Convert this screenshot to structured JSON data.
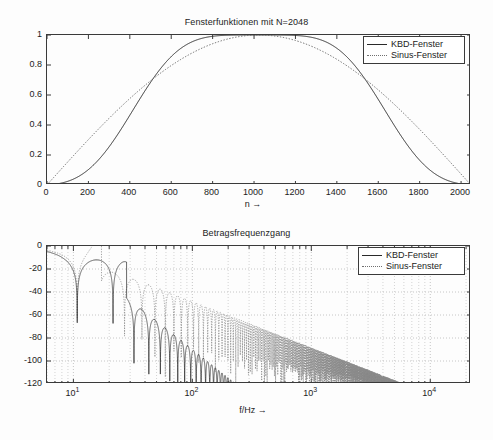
{
  "figure": {
    "background_color": "#fdfdfd",
    "line_color": "#2a2a2a",
    "dotted_color": "#707070",
    "grid_color": "#b8b8b8",
    "axis_color": "#3a3a3a"
  },
  "legend": {
    "entries": [
      {
        "label": "KBD-Fenster",
        "style": "solid"
      },
      {
        "label": "Sinus-Fenster",
        "style": "dotted"
      }
    ]
  },
  "chart_data": [
    {
      "type": "line",
      "id": "window-functions",
      "title": "Fensterfunktionen mit N=2048",
      "xlabel": "n →",
      "ylabel": "",
      "xscale": "linear",
      "yscale": "linear",
      "xlim": [
        0,
        2048
      ],
      "ylim": [
        0,
        1
      ],
      "grid": false,
      "xticks": [
        0,
        200,
        400,
        600,
        800,
        1000,
        1200,
        1400,
        1600,
        1800,
        2000
      ],
      "xtick_labels": [
        "0",
        "200",
        "400",
        "600",
        "800",
        "1000",
        "1200",
        "1400",
        "1600",
        "1800",
        "2000"
      ],
      "yticks": [
        0,
        0.2,
        0.4,
        0.6,
        0.8,
        1
      ],
      "ytick_labels": [
        "0",
        "0.2",
        "0.4",
        "0.6",
        "0.8",
        "1"
      ],
      "legend_position": "upper right",
      "series": [
        {
          "name": "KBD-Fenster",
          "style": "solid",
          "description": "Kaiser-Bessel-derived window, flat-topped near the center, reaching 1.0 between n=800 and n=1250, rising slowly from 0 at n=0.",
          "x": [
            0,
            50,
            100,
            150,
            200,
            250,
            300,
            350,
            400,
            450,
            500,
            550,
            600,
            650,
            700,
            750,
            800,
            850,
            900,
            950,
            1024,
            1100,
            1150,
            1200,
            1250,
            1300,
            1350,
            1400,
            1450,
            1500,
            1550,
            1600,
            1650,
            1700,
            1750,
            1800,
            1850,
            1900,
            1950,
            2000,
            2048
          ],
          "y": [
            0.0,
            0.004,
            0.014,
            0.031,
            0.056,
            0.09,
            0.133,
            0.186,
            0.248,
            0.32,
            0.4,
            0.484,
            0.57,
            0.655,
            0.737,
            0.81,
            0.873,
            0.924,
            0.961,
            0.985,
            1.0,
            0.993,
            0.978,
            0.95,
            0.908,
            0.852,
            0.784,
            0.706,
            0.622,
            0.535,
            0.45,
            0.368,
            0.292,
            0.224,
            0.166,
            0.118,
            0.079,
            0.048,
            0.025,
            0.008,
            0.0
          ]
        },
        {
          "name": "Sinus-Fenster",
          "style": "dotted",
          "description": "Sine window, sin(pi*(n+0.5)/N), peaking at 1.0 at the center n=1024 with a rounded top.",
          "x": [
            0,
            50,
            100,
            150,
            200,
            250,
            300,
            350,
            400,
            450,
            500,
            550,
            600,
            650,
            700,
            750,
            800,
            850,
            900,
            950,
            1024,
            1100,
            1150,
            1200,
            1250,
            1300,
            1350,
            1400,
            1450,
            1500,
            1550,
            1600,
            1650,
            1700,
            1750,
            1800,
            1850,
            1900,
            1950,
            2000,
            2048
          ],
          "y": [
            0.001,
            0.077,
            0.153,
            0.228,
            0.302,
            0.374,
            0.444,
            0.511,
            0.575,
            0.635,
            0.691,
            0.743,
            0.79,
            0.833,
            0.87,
            0.902,
            0.929,
            0.95,
            0.966,
            0.976,
            1.0,
            0.974,
            0.962,
            0.945,
            0.922,
            0.894,
            0.861,
            0.823,
            0.78,
            0.733,
            0.681,
            0.626,
            0.567,
            0.505,
            0.44,
            0.373,
            0.304,
            0.233,
            0.161,
            0.088,
            0.001
          ]
        }
      ]
    },
    {
      "type": "line",
      "id": "magnitude-frequency-response",
      "title": "Betragsfrequenzgang",
      "xlabel": "f/Hz →",
      "ylabel": "",
      "xscale": "log",
      "yscale": "linear",
      "xlim": [
        6,
        22000
      ],
      "ylim": [
        -120,
        0
      ],
      "grid": true,
      "grid_style": "dotted",
      "xticks": [
        10,
        100,
        1000,
        10000
      ],
      "xtick_labels": [
        "10^1",
        "10^2",
        "10^3",
        "10^4"
      ],
      "yticks": [
        0,
        -20,
        -40,
        -60,
        -80,
        -100,
        -120
      ],
      "ytick_labels": [
        "0",
        "-20",
        "-40",
        "-60",
        "-80",
        "-100",
        "-120"
      ],
      "legend_position": "upper right",
      "series": [
        {
          "name": "KBD-Fenster",
          "style": "solid",
          "description": "Magnitude response of the KBD window: flat 0 dB main lobe until ~20 Hz, first null near 38 Hz at -41 dB, first sidelobe peak ~-20 dB at 52 Hz, second null ~-58 dB at 78 Hz, sidelobes decaying steeply; reaches -120 dB floor beyond ~300 Hz.",
          "lobe_peaks_db": [
            0,
            -20,
            -43,
            -64,
            -73,
            -80,
            -86,
            -92,
            -98,
            -104,
            -110,
            -116
          ],
          "lobe_peak_freqs_hz": [
            10,
            52,
            90,
            125,
            160,
            200,
            245,
            300,
            380,
            500,
            700,
            1000
          ],
          "null_depths_db": [
            -41,
            -58,
            -75,
            -90,
            -105,
            -120
          ],
          "null_freqs_hz": [
            38,
            78,
            112,
            150,
            190,
            240
          ]
        },
        {
          "name": "Sinus-Fenster",
          "style": "dotted",
          "description": "Magnitude response of the sine window: same main lobe, but sidelobes decay much more slowly, sidelobe envelope passes -60 dB near 200 Hz, -80 dB near 800 Hz and reaches -120 dB only near 9000 Hz.",
          "sidelobe_envelope_db": [
            -24,
            -40,
            -56,
            -63,
            -72,
            -80,
            -90,
            -100,
            -110,
            -120
          ],
          "sidelobe_envelope_freqs_hz": [
            40,
            80,
            150,
            220,
            400,
            800,
            1600,
            3000,
            5500,
            9000
          ]
        }
      ]
    }
  ]
}
